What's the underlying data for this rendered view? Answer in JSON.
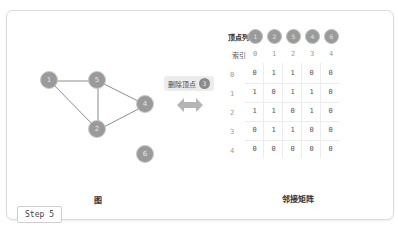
{
  "step": {
    "label": "Step 5"
  },
  "graph": {
    "caption": "图",
    "nodes": [
      {
        "id": "1",
        "label": "1",
        "x": 50,
        "y": 81
      },
      {
        "id": "5",
        "label": "5",
        "x": 98,
        "y": 81
      },
      {
        "id": "4",
        "label": "4",
        "x": 146,
        "y": 105
      },
      {
        "id": "2",
        "label": "2",
        "x": 98,
        "y": 130
      },
      {
        "id": "6",
        "label": "6",
        "x": 146,
        "y": 155
      }
    ],
    "edges": [
      [
        "1",
        "5"
      ],
      [
        "1",
        "2"
      ],
      [
        "5",
        "2"
      ],
      [
        "5",
        "4"
      ],
      [
        "2",
        "4"
      ]
    ]
  },
  "operation": {
    "label": "删除顶点",
    "badge": "3"
  },
  "matrix": {
    "caption": "邻接矩阵",
    "vertex_list_label": "顶点列表",
    "vertex_list": [
      "1",
      "2",
      "5",
      "4",
      "6"
    ],
    "index_label": "索引",
    "col_indices": [
      "0",
      "1",
      "2",
      "3",
      "4"
    ],
    "row_indices": [
      "0",
      "1",
      "2",
      "3",
      "4"
    ],
    "rows": [
      [
        "0",
        "1",
        "1",
        "0",
        "0"
      ],
      [
        "1",
        "0",
        "1",
        "1",
        "0"
      ],
      [
        "1",
        "1",
        "0",
        "1",
        "0"
      ],
      [
        "0",
        "1",
        "1",
        "0",
        "0"
      ],
      [
        "0",
        "0",
        "0",
        "0",
        "0"
      ]
    ]
  }
}
